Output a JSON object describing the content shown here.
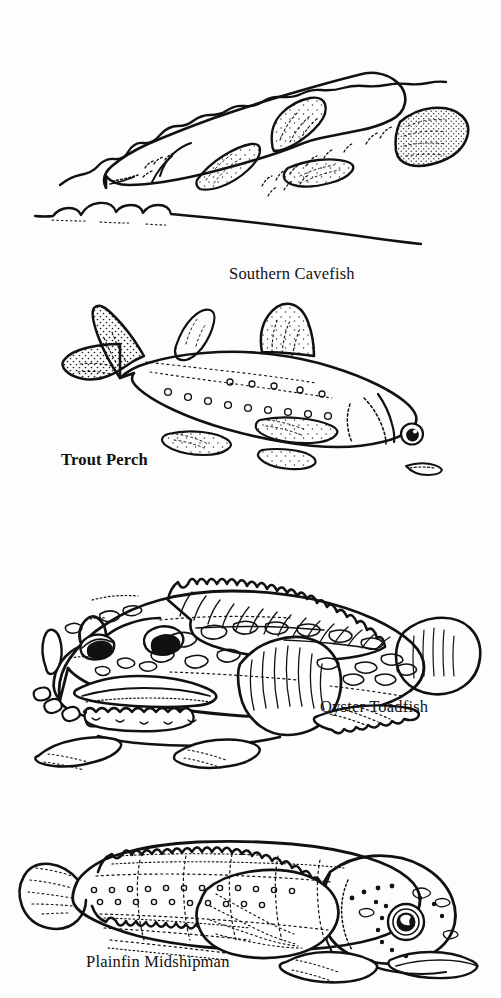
{
  "page": {
    "background_color": "#fdfdfd",
    "ink_color": "#111111",
    "width": 501,
    "height": 998,
    "style": "black-and-white pen-and-ink line drawings"
  },
  "figures": [
    {
      "id": "southern-cavefish",
      "caption": "Southern Cavefish",
      "caption_style": "regular",
      "description": "Eyeless pale cavefish swimming between a wavy cave ceiling line above and a pebbled cave floor line below",
      "features": [
        "blunt eyeless head",
        "stippled dorsal fin",
        "stippled caudal fin",
        "stippled pectoral fin",
        "sensory papillae rows",
        "cave ceiling line",
        "cave floor line with pebbles"
      ]
    },
    {
      "id": "trout-perch",
      "caption": "Trout Perch",
      "caption_style": "bold",
      "description": "Slender fish with forked tail, large round eye, spotted lateral row and stippled fins",
      "features": [
        "forked caudal fin",
        "spiny dorsal fin",
        "adipose fin",
        "large round eye",
        "row of lateral spots",
        "stippled fins"
      ]
    },
    {
      "id": "oyster-toadfish",
      "caption": "Oyster Toadfish",
      "caption_style": "regular",
      "description": "Broad warty-headed bottom fish with sawtooth dorsal fin, wide toothed mouth, fleshy barbels and large rounded pectoral fins",
      "features": [
        "sawtooth spiny dorsal fin",
        "mottled blotched body",
        "wide toothed mouth",
        "fleshy head barbels",
        "two bulging eyes",
        "large rounded pectoral fin",
        "fan-shaped caudal fin",
        "pelvic fins"
      ]
    },
    {
      "id": "plainfin-midshipman",
      "caption": "Plainfin Midshipman",
      "caption_style": "regular",
      "description": "Elongate bottom fish with long scalloped dorsal and anal fins and rows of photophore dots along the body and head",
      "features": [
        "long scalloped dorsal fin",
        "long anal fin",
        "rows of photophores",
        "large dark eye",
        "rounded caudal fin",
        "broad pectoral fin",
        "pelvic fins"
      ]
    }
  ]
}
